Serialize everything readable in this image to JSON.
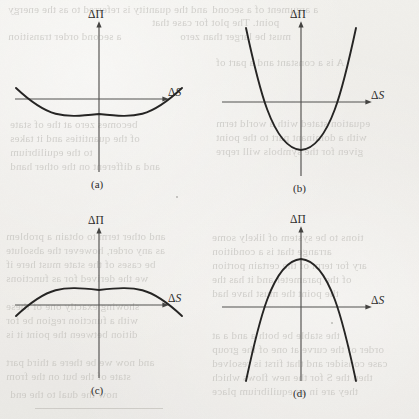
{
  "figure": {
    "kind": "scanned-book-figure",
    "width": 419,
    "height": 419,
    "background_color": "#eeeeea",
    "ink_color": "#1d1c1b",
    "axis_color": "#4b4a48",
    "bleed_text_color": "#b9b7b2"
  },
  "axis_labels": {
    "vertical": "ΔΠ",
    "horizontal_delta": "Δ",
    "horizontal_var": "S"
  },
  "panels": [
    {
      "id": "a",
      "caption": "(a)",
      "curve": "shallow-upward-parabola",
      "description": "Shallow convex (minimum) curve dipping just below the ΔS axis",
      "vertex_sign": "slightly-negative",
      "opens": "up"
    },
    {
      "id": "b",
      "caption": "(b)",
      "curve": "steep-upward-parabola",
      "description": "Steep convex (minimum) curve with vertex far below the ΔS axis",
      "vertex_sign": "strongly-negative",
      "opens": "up"
    },
    {
      "id": "c",
      "caption": "(c)",
      "curve": "shallow-downward-parabola",
      "description": "Shallow concave (maximum) curve peaking just above the ΔS axis",
      "vertex_sign": "slightly-positive",
      "opens": "down"
    },
    {
      "id": "d",
      "caption": "(d)",
      "curve": "steep-downward-parabola",
      "description": "Steep concave (maximum) curve with apex far above the ΔS axis",
      "vertex_sign": "strongly-positive",
      "opens": "down"
    }
  ],
  "chart_data": {
    "type": "line",
    "title": "",
    "xlabel": "ΔS",
    "ylabel": "ΔΠ",
    "grid": false,
    "legend": "none",
    "panel_layout": "2x2",
    "x": [
      -1,
      -0.75,
      -0.5,
      -0.25,
      0,
      0.25,
      0.5,
      0.75,
      1
    ],
    "panels": [
      {
        "id": "a",
        "caption": "(a)",
        "curvature": "convex",
        "equation_form": "y = a*x^2 + c, a > 0 small, c < 0 small",
        "values": [
          0.09,
          0.01,
          -0.05,
          -0.08,
          -0.09,
          -0.08,
          -0.05,
          0.01,
          0.09
        ],
        "xlim": [
          -1,
          1
        ],
        "ylim": [
          -0.6,
          0.6
        ]
      },
      {
        "id": "b",
        "caption": "(b)",
        "curvature": "convex",
        "equation_form": "y = a*x^2 + c, a > 0 large, c < 0 large",
        "values": [
          0.72,
          0.28,
          -0.05,
          -0.27,
          -0.34,
          -0.27,
          -0.05,
          0.28,
          0.72
        ],
        "xlim": [
          -1,
          1
        ],
        "ylim": [
          -0.6,
          0.9
        ]
      },
      {
        "id": "c",
        "caption": "(c)",
        "curvature": "concave",
        "equation_form": "y = -a*x^2 + c, a > 0 small, c > 0 small",
        "values": [
          -0.09,
          -0.01,
          0.05,
          0.08,
          0.09,
          0.08,
          0.05,
          -0.01,
          -0.09
        ],
        "xlim": [
          -1,
          1
        ],
        "ylim": [
          -0.6,
          0.6
        ]
      },
      {
        "id": "d",
        "caption": "(d)",
        "curvature": "concave",
        "equation_form": "y = -a*x^2 + c, a > 0 large, c > 0 large",
        "values": [
          -0.72,
          -0.28,
          0.05,
          0.27,
          0.34,
          0.27,
          0.05,
          -0.28,
          -0.72
        ],
        "xlim": [
          -1,
          1
        ],
        "ylim": [
          -0.9,
          0.6
        ]
      }
    ]
  },
  "bleed_through": {
    "note": "Faint mirrored text showing through from the reverse side of the scanned page",
    "lines": [
      {
        "text": "and the quantity is referred to as the energy",
        "x": 8,
        "y": 3,
        "size": 11
      },
      {
        "text": "point. The plot for  case that",
        "x": 152,
        "y": 16,
        "size": 11
      },
      {
        "text": "a second order transition",
        "x": 8,
        "y": 30,
        "size": 11
      },
      {
        "text": "must be larger than zero",
        "x": 180,
        "y": 30,
        "size": 11
      },
      {
        "text": "becomes zero at the of state",
        "x": 10,
        "y": 118,
        "size": 11
      },
      {
        "text": "of the quantities and  it takes",
        "x": 10,
        "y": 132,
        "size": 11
      },
      {
        "text": "to the equilibrium",
        "x": 10,
        "y": 146,
        "size": 11
      },
      {
        "text": "and other term  to obtain a problem",
        "x": 6,
        "y": 230,
        "size": 11
      },
      {
        "text": "as any order, however the absolute",
        "x": 6,
        "y": 244,
        "size": 11
      },
      {
        "text": "be cases of the state must here if",
        "x": 6,
        "y": 258,
        "size": 11
      },
      {
        "text": "we  the derived for  as functions",
        "x": 6,
        "y": 272,
        "size": 11
      },
      {
        "text": "showing     exactly one of these",
        "x": 6,
        "y": 300,
        "size": 11
      },
      {
        "text": "with a function  region be for",
        "x": 6,
        "y": 314,
        "size": 11
      },
      {
        "text": "dition  between the point it is",
        "x": 6,
        "y": 328,
        "size": 11
      },
      {
        "text": "and now we be there a  third part",
        "x": 6,
        "y": 356,
        "size": 11
      },
      {
        "text": "state of the but on  the  from",
        "x": 6,
        "y": 370,
        "size": 11
      },
      {
        "text": "a argument of a  second",
        "x": 212,
        "y": 3,
        "size": 11
      },
      {
        "text": "tions to be system  of  likely some",
        "x": 212,
        "y": 231,
        "size": 11
      },
      {
        "text": "arrange  that is  a  condition",
        "x": 212,
        "y": 245,
        "size": 11
      },
      {
        "text": "ary for  term  of the   certain portion",
        "x": 212,
        "y": 259,
        "size": 11
      },
      {
        "text": "of  the parameter   and  it  has the",
        "x": 212,
        "y": 273,
        "size": 11
      },
      {
        "text": "the  point  the  must have had",
        "x": 212,
        "y": 287,
        "size": 11
      },
      {
        "text": "the  stable  be  both  a  and  a  at",
        "x": 212,
        "y": 329,
        "size": 11
      },
      {
        "text": "order of  the  curve  at one  of  the  group",
        "x": 212,
        "y": 343,
        "size": 11
      },
      {
        "text": "case  consider  and  that  first  is  resolved",
        "x": 212,
        "y": 357,
        "size": 11
      },
      {
        "text": "then  the  S  for  the  new   flows  which",
        "x": 212,
        "y": 371,
        "size": 11
      },
      {
        "text": "they  are  in  an  equilibrium  place",
        "x": 212,
        "y": 385,
        "size": 11
      },
      {
        "text": "now  the   dual   to   the   end",
        "x": 10,
        "y": 388,
        "size": 11
      },
      {
        "text": "and  a  different  on  the  other  hand",
        "x": 10,
        "y": 160,
        "size": 11
      },
      {
        "text": "equation  stated  with  a  world  term",
        "x": 216,
        "y": 117,
        "size": 11
      },
      {
        "text": "with  a  dominant  part  to  the  point",
        "x": 216,
        "y": 131,
        "size": 11
      },
      {
        "text": "given  for  the  symbols  will  repre",
        "x": 216,
        "y": 145,
        "size": 11
      },
      {
        "text": "A  is  a  constant  and  a  part  of",
        "x": 216,
        "y": 56,
        "size": 11
      }
    ]
  }
}
